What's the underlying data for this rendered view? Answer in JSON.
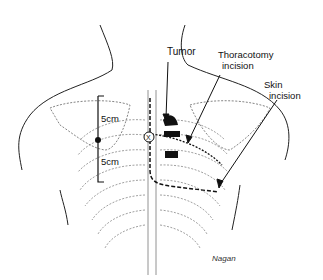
{
  "figure": {
    "type": "anatomical illustration"
  },
  "labels": {
    "tumor": "Tumor",
    "thoracotomy_line1": "Thoracotomy",
    "thoracotomy_line2": "incision",
    "skin_line1": "Skin",
    "skin_line2": "incision",
    "measure_upper": "5cm",
    "measure_lower": "5cm",
    "marker": "X",
    "signature": "Nagan"
  }
}
